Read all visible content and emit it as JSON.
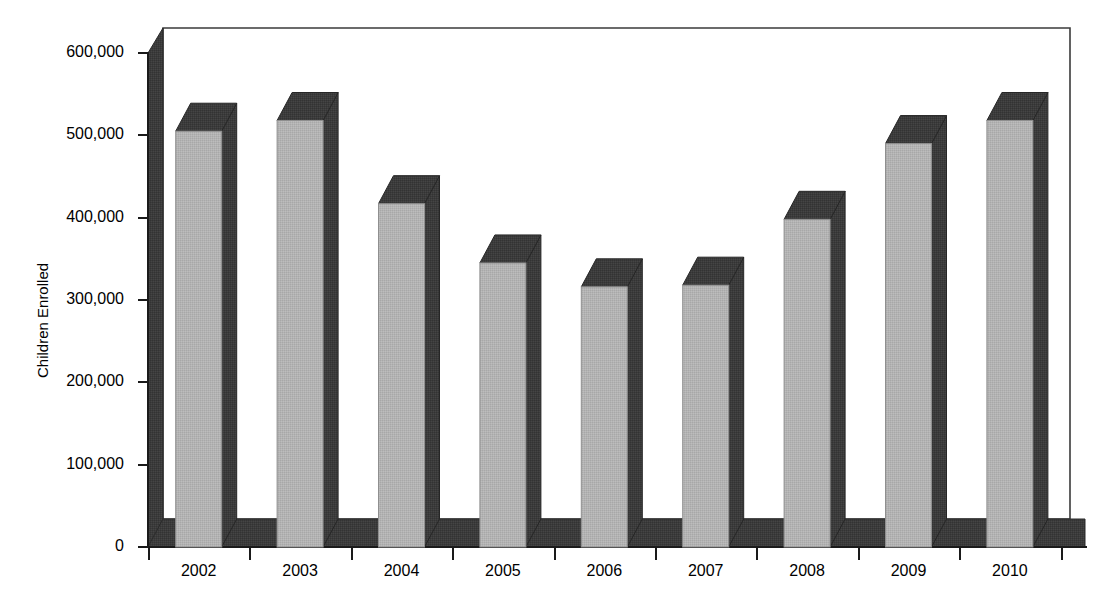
{
  "chart_data": {
    "type": "bar",
    "title": "",
    "subtitle": "",
    "xlabel": "",
    "ylabel": "Children Enrolled",
    "categories": [
      "2002",
      "2003",
      "2004",
      "2005",
      "2006",
      "2007",
      "2008",
      "2009",
      "2010"
    ],
    "values": [
      505000,
      518000,
      417000,
      345000,
      316000,
      318000,
      398000,
      490000,
      518000
    ],
    "ylim": [
      0,
      600000
    ],
    "y_ticks": [
      0,
      100000,
      200000,
      300000,
      400000,
      500000,
      600000
    ],
    "y_tick_labels": [
      "0",
      "100,000",
      "200,000",
      "300,000",
      "400,000",
      "500,000",
      "600,000"
    ],
    "grid": false,
    "legend": null,
    "legend_position": "none",
    "style": "3d-column",
    "series": [
      {
        "name": "Children Enrolled",
        "values": [
          505000,
          518000,
          417000,
          345000,
          316000,
          318000,
          398000,
          490000,
          518000
        ]
      }
    ],
    "annotations": []
  },
  "colors": {
    "bar_front": "#b3b3b3",
    "bar_top": "#3b3b3b",
    "bar_side": "#3b3b3b",
    "floor": "#3b3b3b",
    "wall": "#3b3b3b",
    "axis_line": "#1a1a1a",
    "back_wall": "#ffffff",
    "text": "#000000"
  }
}
